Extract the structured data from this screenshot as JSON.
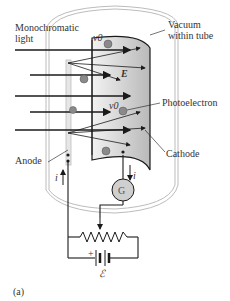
{
  "labels": {
    "light": "Monochromatic\nlight",
    "light_line1": "Monochromatic",
    "light_line2": "light",
    "vacuum_line1": "Vacuum",
    "vacuum_line2": "within tube",
    "photoelectron": "Photoelectron",
    "cathode": "Cathode",
    "anode": "Anode",
    "field": "E",
    "velocity_top": "v0",
    "velocity_mid": "v0",
    "current_left": "i",
    "current_right": "i",
    "galvanometer": "G",
    "battery_plus": "+",
    "emf": "ℰ",
    "panel": "(a)"
  },
  "colors": {
    "line": "#1a1a1a",
    "cathode_fill": "#c8c8c8",
    "electron": "#8a8a8a",
    "tube": "#bcbcbc",
    "galvanometer_fill": "#cfcfcf"
  }
}
